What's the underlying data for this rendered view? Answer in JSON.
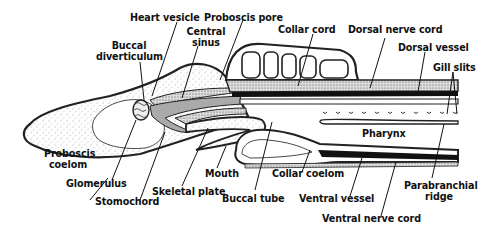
{
  "diagram": {
    "labels": {
      "heart_vesicle": "Heart vesicle",
      "proboscis_pore": "Proboscis pore",
      "collar_cord": "Collar cord",
      "dorsal_nerve_cord": "Dorsal nerve cord",
      "buccal_diverticulum_1": "Buccal",
      "buccal_diverticulum_2": "diverticulum",
      "central_sinus_1": "Central",
      "central_sinus_2": "sinus",
      "dorsal_vessel": "Dorsal vessel",
      "gill_slits": "Gill slits",
      "pharynx": "Pharynx",
      "proboscis_coelom_1": "Proboscis",
      "proboscis_coelom_2": "coelom",
      "glomerulus": "Glomerulus",
      "mouth": "Mouth",
      "collar_coelom": "Collar coelom",
      "skeletal_plate": "Skeletal plate",
      "stomochord": "Stomochord",
      "buccal_tube": "Buccal tube",
      "ventral_vessel": "Ventral vessel",
      "parabranchial_ridge_1": "Parabranchial",
      "parabranchial_ridge_2": "ridge",
      "ventral_nerve_cord": "Ventral nerve cord"
    }
  }
}
